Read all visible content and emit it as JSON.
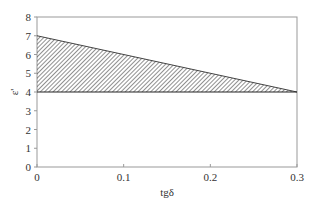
{
  "chart_data": {
    "type": "area",
    "title": "",
    "xlabel": "tgδ",
    "ylabel": "ε'",
    "xlim": [
      0,
      0.3
    ],
    "ylim": [
      0,
      8
    ],
    "x_ticks": [
      "0",
      "0.1",
      "0.2",
      "0.3"
    ],
    "y_ticks": [
      "0",
      "1",
      "2",
      "3",
      "4",
      "5",
      "6",
      "7",
      "8"
    ],
    "grid": false,
    "legend": null,
    "series": [
      {
        "name": "upper boundary",
        "x": [
          0,
          0.3
        ],
        "y": [
          7,
          4
        ]
      },
      {
        "name": "lower boundary",
        "x": [
          0,
          0.3
        ],
        "y": [
          4,
          4
        ]
      }
    ],
    "shaded_region": {
      "description": "hatched region between upper line (7 at 0 to 4 at 0.3) and lower line ε'=4",
      "fill": "diagonal hatch",
      "vertices": [
        [
          0,
          7
        ],
        [
          0.3,
          4
        ],
        [
          0,
          4
        ]
      ]
    }
  },
  "colors": {
    "axis": "#999999",
    "hatch": "#333333",
    "text": "#333333"
  }
}
